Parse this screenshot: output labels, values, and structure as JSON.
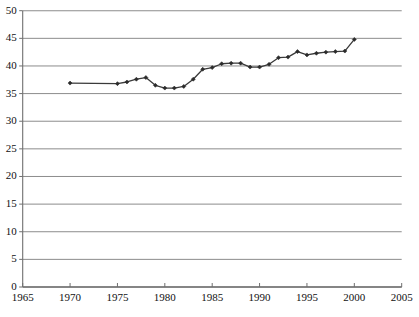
{
  "chart": {
    "title": "",
    "subtitle": "",
    "type_label": "line-chart"
  },
  "axes": {
    "x_label": "",
    "y_label": "",
    "x_ticks": [
      "1965",
      "1970",
      "1975",
      "1980",
      "1985",
      "1990",
      "1995",
      "2000",
      "2005"
    ],
    "y_ticks": [
      "0",
      "5",
      "10",
      "15",
      "20",
      "25",
      "30",
      "35",
      "40",
      "45",
      "50"
    ]
  },
  "style": {
    "line_color": "#3a3a3a",
    "marker_color": "#2b2b2b",
    "grid_color": "#8c8c8c",
    "axis_color": "#6f6f6f",
    "background": "#ffffff"
  },
  "chart_data": {
    "type": "line",
    "title": "",
    "xlabel": "",
    "ylabel": "",
    "xlim": [
      1965,
      2005
    ],
    "ylim": [
      0,
      50
    ],
    "xticks": [
      1965,
      1970,
      1975,
      1980,
      1985,
      1990,
      1995,
      2000,
      2005
    ],
    "yticks": [
      0,
      5,
      10,
      15,
      20,
      25,
      30,
      35,
      40,
      45,
      50
    ],
    "grid": "horizontal",
    "legend": "none",
    "markers": "diamond",
    "x": [
      1970,
      1975,
      1976,
      1977,
      1978,
      1979,
      1980,
      1981,
      1982,
      1983,
      1984,
      1985,
      1986,
      1987,
      1988,
      1989,
      1990,
      1991,
      1992,
      1993,
      1994,
      1995,
      1996,
      1997,
      1998,
      1999,
      2000
    ],
    "y": [
      36.9,
      36.8,
      37.1,
      37.6,
      37.9,
      36.5,
      36.0,
      36.0,
      36.3,
      37.6,
      39.4,
      39.7,
      40.4,
      40.5,
      40.5,
      39.8,
      39.8,
      40.3,
      41.5,
      41.6,
      42.6,
      42.0,
      42.3,
      42.5,
      42.6,
      42.7,
      44.8
    ],
    "series": [
      {
        "name": "series-1",
        "values": [
          36.9,
          36.8,
          37.1,
          37.6,
          37.9,
          36.5,
          36.0,
          36.0,
          36.3,
          37.6,
          39.4,
          39.7,
          40.4,
          40.5,
          40.5,
          39.8,
          39.8,
          40.3,
          41.5,
          41.6,
          42.6,
          42.0,
          42.3,
          42.5,
          42.6,
          42.7,
          44.8
        ]
      }
    ]
  }
}
